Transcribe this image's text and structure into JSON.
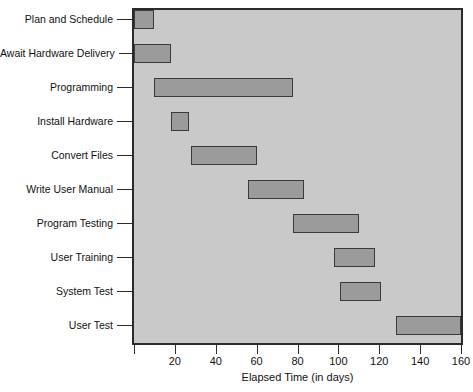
{
  "chart_data": {
    "type": "bar",
    "orientation": "horizontal",
    "subtype": "gantt",
    "title": "",
    "xlabel": "Elapsed Time (in days)",
    "ylabel": "",
    "xlim": [
      0,
      160
    ],
    "xticks": [
      0,
      20,
      40,
      60,
      80,
      100,
      120,
      140,
      160
    ],
    "xticklabels": [
      "",
      "20",
      "40",
      "60",
      "80",
      "100",
      "120",
      "140",
      "160"
    ],
    "grid": false,
    "legend": null,
    "plot_background": "#c9c9c9",
    "bar_color": "#9b9b9b",
    "bar_edge_color": "#3a3a3a",
    "categories": [
      "Plan and Schedule",
      "Await Hardware Delivery",
      "Programming",
      "Install Hardware",
      "Convert Files",
      "Write User Manual",
      "Program Testing",
      "User Training",
      "System Test",
      "User Test"
    ],
    "tasks": [
      {
        "name": "Plan and Schedule",
        "start": 0,
        "end": 10,
        "duration": 10
      },
      {
        "name": "Await Hardware Delivery",
        "start": 0,
        "end": 18,
        "duration": 18
      },
      {
        "name": "Programming",
        "start": 10,
        "end": 78,
        "duration": 68
      },
      {
        "name": "Install Hardware",
        "start": 18,
        "end": 27,
        "duration": 9
      },
      {
        "name": "Convert Files",
        "start": 28,
        "end": 60,
        "duration": 32
      },
      {
        "name": "Write User Manual",
        "start": 56,
        "end": 83,
        "duration": 27
      },
      {
        "name": "Program Testing",
        "start": 78,
        "end": 110,
        "duration": 32
      },
      {
        "name": "User Training",
        "start": 98,
        "end": 118,
        "duration": 20
      },
      {
        "name": "System Test",
        "start": 101,
        "end": 121,
        "duration": 20
      },
      {
        "name": "User Test",
        "start": 128,
        "end": 160,
        "duration": 32
      }
    ]
  }
}
